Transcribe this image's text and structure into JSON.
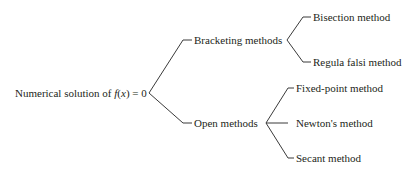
{
  "diagram": {
    "type": "tree",
    "root": {
      "label_prefix": "Numerical solution of ",
      "label_func": "f",
      "label_paren_open": "(",
      "label_var": "x",
      "label_suffix": ") = 0"
    },
    "branches": [
      {
        "label": "Bracketing methods",
        "children": [
          {
            "label": "Bisection method"
          },
          {
            "label": "Regula falsi method"
          }
        ]
      },
      {
        "label": "Open methods",
        "children": [
          {
            "label": "Fixed-point method"
          },
          {
            "label": "Newton's method"
          },
          {
            "label": "Secant method"
          }
        ]
      }
    ]
  },
  "colors": {
    "text": "#231f20",
    "lines": "#3a3a3a",
    "background": "#ffffff"
  }
}
